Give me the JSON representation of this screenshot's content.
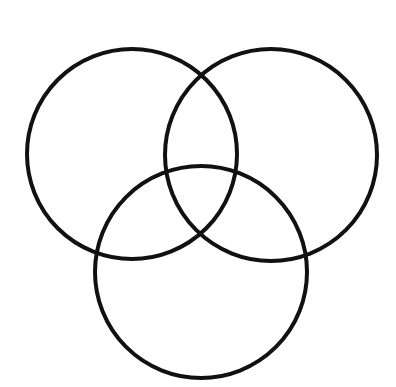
{
  "diagram": {
    "type": "venn",
    "background": "#ffffff",
    "stroke_color": "#111111",
    "stroke_width": 4,
    "circles": [
      {
        "id": "left",
        "cx": 132,
        "cy": 154,
        "r": 105
      },
      {
        "id": "right",
        "cx": 271,
        "cy": 155,
        "r": 106
      },
      {
        "id": "bottom",
        "cx": 201,
        "cy": 272,
        "r": 106
      }
    ]
  }
}
